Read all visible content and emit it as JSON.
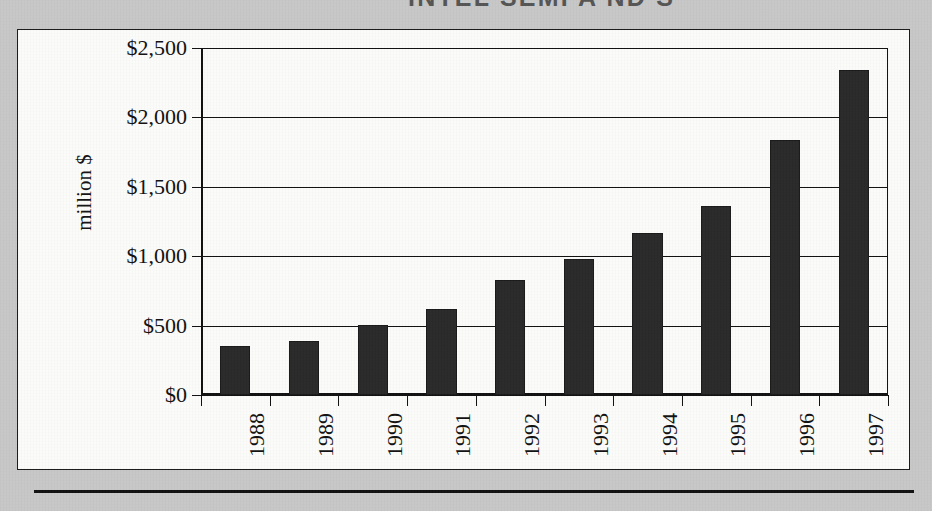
{
  "document": {
    "title_partial": "INTEL SEMI A  ND  S",
    "bottom_rule": "horizontal-rule"
  },
  "chart_data": {
    "type": "bar",
    "title": "",
    "xlabel": "",
    "ylabel": "million $",
    "categories": [
      "1988",
      "1989",
      "1990",
      "1991",
      "1992",
      "1993",
      "1994",
      "1995",
      "1996",
      "1997"
    ],
    "values": [
      350,
      390,
      505,
      620,
      830,
      980,
      1165,
      1360,
      1840,
      2340
    ],
    "ylim": [
      0,
      2500
    ],
    "ytick_values": [
      0,
      500,
      1000,
      1500,
      2000,
      2500
    ],
    "ytick_labels": [
      "$0",
      "$500",
      "$1,000",
      "$1,500",
      "$2,000",
      "$2,500"
    ],
    "grid": true,
    "grid_axis": "y",
    "legend": false,
    "bar_color": "#2a2a2a",
    "series": [
      {
        "name": "revenue",
        "values": [
          350,
          390,
          505,
          620,
          830,
          980,
          1165,
          1360,
          1840,
          2340
        ]
      }
    ]
  },
  "colors": {
    "paper": "#c9c9c9",
    "panel": "#fdfdfb",
    "ink": "#111111",
    "bar": "#2a2a2a"
  }
}
